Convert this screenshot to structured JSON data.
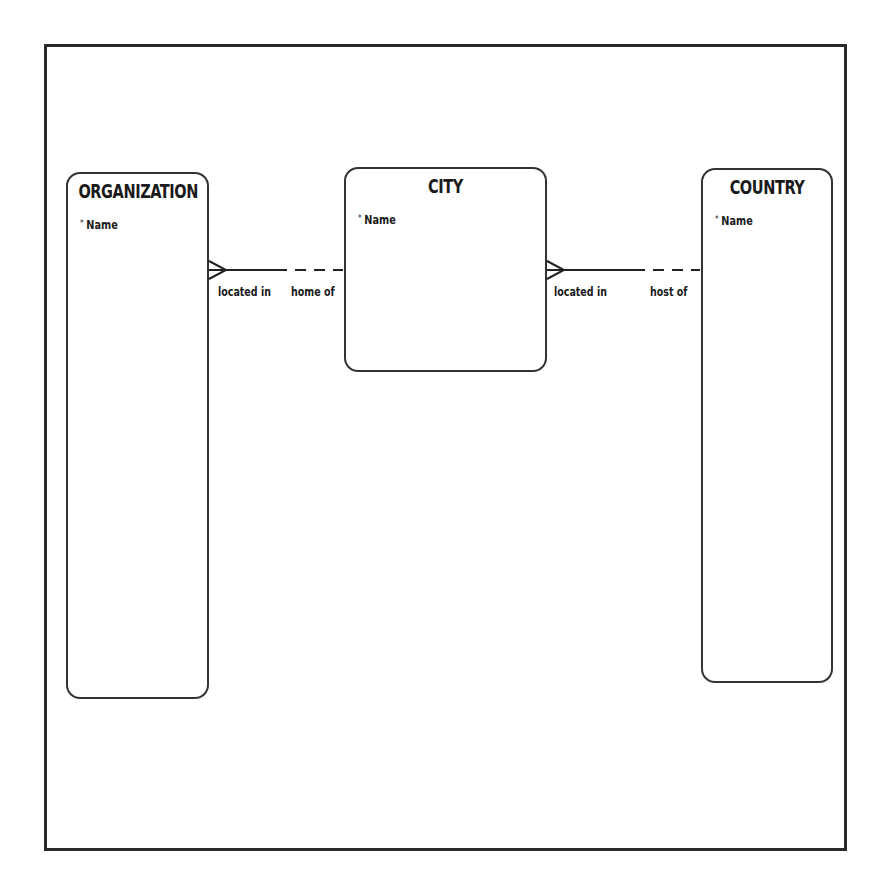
{
  "diagram": {
    "type": "entity-relationship",
    "entities": [
      {
        "name": "ORGANIZATION",
        "attributes": [
          {
            "marker": "*",
            "name": "Name"
          }
        ]
      },
      {
        "name": "CITY",
        "attributes": [
          {
            "marker": "*",
            "name": "Name"
          }
        ]
      },
      {
        "name": "COUNTRY",
        "attributes": [
          {
            "marker": "*",
            "name": "Name"
          }
        ]
      }
    ],
    "relationships": [
      {
        "from": "ORGANIZATION",
        "to": "CITY",
        "from_label": "located in",
        "to_label": "home of",
        "from_cardinality": "many",
        "from_optionality": "mandatory",
        "to_optionality": "optional"
      },
      {
        "from": "CITY",
        "to": "COUNTRY",
        "from_label": "located in",
        "to_label": "host of",
        "from_cardinality": "many",
        "from_optionality": "mandatory",
        "to_optionality": "optional"
      }
    ]
  }
}
